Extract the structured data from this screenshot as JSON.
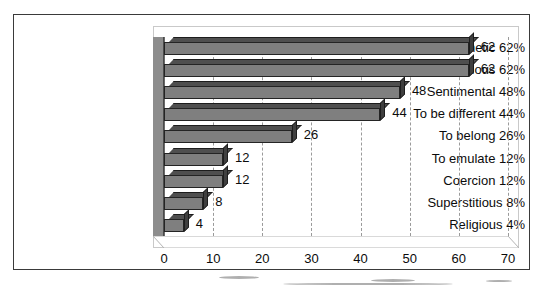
{
  "chart_data": {
    "type": "bar",
    "orientation": "horizontal",
    "title": "",
    "xlabel": "",
    "ylabel": "",
    "categories": [
      "Aesthetic 62%",
      "Rebellious 62%",
      "Sentimental 48%",
      "To be different 44%",
      "To belong 26%",
      "To emulate 12%",
      "Coercion 12%",
      "Superstitious 8%",
      "Religious 4%"
    ],
    "values": [
      62,
      62,
      48,
      44,
      26,
      12,
      12,
      8,
      4
    ],
    "data_labels": [
      "62",
      "62",
      "48",
      "44",
      "26",
      "12",
      "12",
      "8",
      "4"
    ],
    "xlim": [
      0,
      70
    ],
    "xticks": [
      0,
      10,
      20,
      30,
      40,
      50,
      60,
      70
    ],
    "xtick_labels": [
      "0",
      "10",
      "20",
      "30",
      "40",
      "50",
      "60",
      "70"
    ],
    "grid": true,
    "grid_axis": "x",
    "grid_style": "dashed",
    "legend": false,
    "style_3d": true,
    "colors": {
      "bar_face": "#7f7f7f",
      "bar_top": "#4f4f4f",
      "bar_cap": "#3f3f3f",
      "bar_outline": "#242424",
      "wall": "#8d8d8d",
      "gridline": "#9a9a9a",
      "plot_frame": "#c9c9c9",
      "outer_frame": "#3a3a3a",
      "text": "#0b0b0b",
      "background": "#ffffff"
    }
  }
}
